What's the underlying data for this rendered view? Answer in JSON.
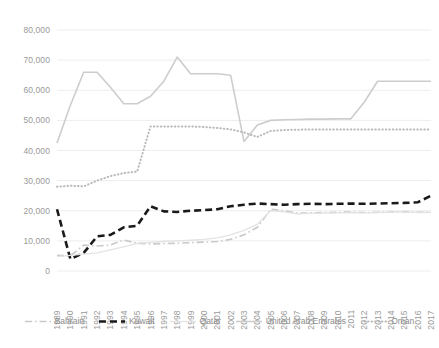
{
  "chart_data": {
    "type": "line",
    "title": "",
    "subtitle": "",
    "xlabel": "",
    "ylabel": "",
    "ylim": [
      0,
      80000
    ],
    "grid": true,
    "legend_position": "bottom",
    "y_ticks": [
      "0",
      "10,000",
      "20,000",
      "30,000",
      "40,000",
      "50,000",
      "60,000",
      "70,000",
      "80,000"
    ],
    "y_tick_values": [
      0,
      10000,
      20000,
      30000,
      40000,
      50000,
      60000,
      70000,
      80000
    ],
    "categories": [
      "1989",
      "1990",
      "1991",
      "1992",
      "1993",
      "1994",
      "1995",
      "1996",
      "1997",
      "1998",
      "1999",
      "2000",
      "2001",
      "2002",
      "2003",
      "2004",
      "2005",
      "2006",
      "2007",
      "2008",
      "2009",
      "2010",
      "2011",
      "2012",
      "2013",
      "2014",
      "2015",
      "2016",
      "2017"
    ],
    "series": [
      {
        "name": "Bahrain",
        "color": "#c9c9c9",
        "style": "dash-dot",
        "values": [
          5200,
          5000,
          8600,
          8300,
          8600,
          10300,
          9200,
          9000,
          9100,
          9200,
          9400,
          9600,
          9800,
          10500,
          12000,
          14500,
          20500,
          20000,
          19200,
          19300,
          19400,
          19500,
          19600,
          19400,
          19500,
          19600,
          19700,
          19500,
          19600
        ]
      },
      {
        "name": "Kuwait",
        "color": "#1a1a1a",
        "style": "dash",
        "values": [
          20500,
          4000,
          6000,
          11500,
          12000,
          14500,
          15000,
          21500,
          19800,
          19600,
          20000,
          20200,
          20500,
          21500,
          22000,
          22400,
          22200,
          22000,
          22200,
          22300,
          22200,
          22300,
          22400,
          22300,
          22400,
          22500,
          22600,
          22800,
          25000
        ]
      },
      {
        "name": "Qatar",
        "color": "#e3e3e3",
        "style": "solid-light",
        "values": [
          4800,
          5200,
          5600,
          6000,
          7000,
          8000,
          9200,
          9500,
          9800,
          10000,
          10200,
          10500,
          11000,
          12000,
          13500,
          15500,
          20000,
          19600,
          19000,
          19100,
          19200,
          19300,
          19400,
          19300,
          19400,
          19500,
          19600,
          19400,
          19500
        ]
      },
      {
        "name": "United Arab Emirates",
        "color": "#cdcdcd",
        "style": "solid",
        "values": [
          42500,
          55000,
          66000,
          66000,
          61000,
          55500,
          55500,
          58000,
          63000,
          71000,
          65500,
          65500,
          65500,
          65000,
          43000,
          48500,
          50000,
          50200,
          50300,
          50400,
          50400,
          50500,
          50500,
          56000,
          63000,
          63000,
          63000,
          63000,
          63000
        ]
      },
      {
        "name": "Oman",
        "color": "#b8b8b8",
        "style": "dotted",
        "values": [
          28000,
          28300,
          28100,
          30000,
          31500,
          32500,
          33000,
          48000,
          48000,
          48000,
          48000,
          47800,
          47500,
          47000,
          46000,
          44500,
          46500,
          46800,
          46900,
          47000,
          47000,
          47000,
          47000,
          47000,
          47000,
          47000,
          47000,
          47000,
          47000
        ]
      }
    ]
  },
  "legend": {
    "items": [
      {
        "label": "Bahrain",
        "icon": "dash-dot-line-icon"
      },
      {
        "label": "Kuwait",
        "icon": "dash-line-icon"
      },
      {
        "label": "Qatar",
        "icon": "solid-line-icon"
      },
      {
        "label": "United Arab Emirates",
        "icon": "solid-line-icon"
      },
      {
        "label": "Oman",
        "icon": "dotted-line-icon"
      }
    ]
  }
}
